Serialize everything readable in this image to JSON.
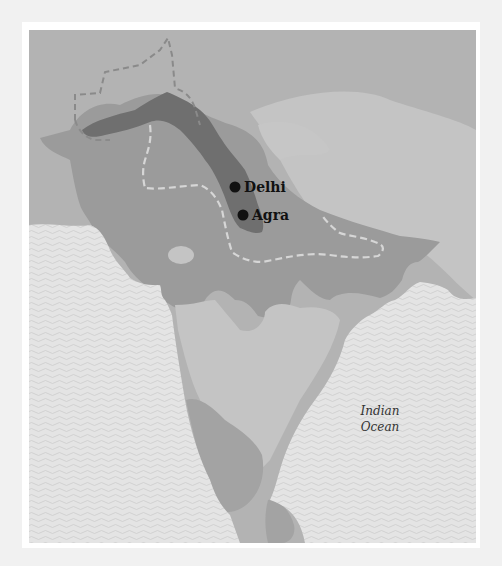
{
  "map": {
    "title": "",
    "cities": [
      {
        "name": "Delhi",
        "x": 235,
        "y": 187
      },
      {
        "name": "Agra",
        "x": 243,
        "y": 215
      }
    ],
    "water_labels": [
      {
        "line1": "Indian",
        "line2": "Ocean"
      }
    ],
    "colors": {
      "page_background": "#f1f1f1",
      "frame": "#ffffff",
      "background_land": "#b3b3b3",
      "light_land": "#c4c4c4",
      "region_mid": "#9b9b9b",
      "region_dark": "#6f6f6f",
      "ocean": "#e4e4e4",
      "ocean_wave": "#cfcfcf",
      "dashed_outer": "#8a8a8a",
      "dashed_inner": "#d6d6d6",
      "city_marker": "#111111"
    },
    "legend": []
  }
}
